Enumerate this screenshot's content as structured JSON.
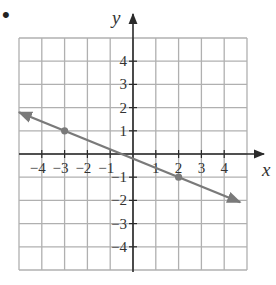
{
  "bullet": "•",
  "chart_data": {
    "type": "line",
    "title": "",
    "xlabel": "x",
    "ylabel": "y",
    "xlim": [
      -5,
      5
    ],
    "ylim": [
      -5,
      5
    ],
    "grid": true,
    "x_ticks": [
      -4,
      -3,
      -2,
      -1,
      1,
      2,
      3,
      4
    ],
    "y_ticks": [
      4,
      3,
      2,
      1,
      -1,
      -2,
      -3,
      -4
    ],
    "x_tick_labels": [
      "−4",
      "−3",
      "−2",
      "−1",
      "1",
      "2",
      "3",
      "4"
    ],
    "y_tick_labels": [
      "4",
      "3",
      "2",
      "1",
      "1",
      "2",
      "3",
      "4"
    ],
    "series": [
      {
        "name": "line",
        "equation": "y = -2/5 x - 1/5",
        "slope": -0.4,
        "intercept": -0.2,
        "endpoints": [
          [
            -5,
            1.8
          ],
          [
            4.7,
            -2.08
          ]
        ],
        "arrows": "both",
        "color": "#7a7a7a",
        "marked_points": [
          [
            -3,
            1
          ],
          [
            2,
            -1
          ]
        ]
      }
    ],
    "legend": null
  },
  "colors": {
    "grid": "#b0b0b0",
    "axis": "#2a2a2a",
    "line": "#7a7a7a",
    "text": "#333333"
  }
}
